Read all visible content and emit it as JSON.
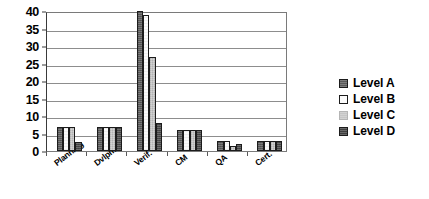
{
  "chart_data": {
    "type": "bar",
    "title": "",
    "subtitle": "",
    "xlabel": "",
    "ylabel": "",
    "categories": [
      "Planning",
      "Dvlpmt",
      "Verif.",
      "CM",
      "QA",
      "Cert."
    ],
    "series": [
      {
        "name": "Level A",
        "color": "#595959",
        "values": [
          7,
          7,
          40,
          6,
          3,
          3
        ]
      },
      {
        "name": "Level B",
        "color": "#fbfbfb",
        "values": [
          7,
          7,
          39,
          6,
          3,
          3
        ]
      },
      {
        "name": "Level C",
        "color": "#c6c6c6",
        "values": [
          7,
          7,
          27,
          6,
          1.5,
          3
        ]
      },
      {
        "name": "Level D",
        "color": "#474747",
        "values": [
          2.5,
          7,
          8,
          6,
          2,
          3
        ]
      }
    ],
    "ylim": [
      0,
      40
    ],
    "yticks": [
      0,
      5,
      10,
      15,
      20,
      25,
      30,
      35,
      40
    ],
    "ytick_labels": [
      "0",
      "5",
      "10",
      "15",
      "20",
      "25",
      "30",
      "35",
      "40"
    ],
    "grid": true,
    "grid_axis": "y",
    "legend": true,
    "legend_position": "right",
    "legend_entries": [
      "Level A",
      "Level B",
      "Level C",
      "Level D"
    ],
    "xtick_rotation": -38,
    "plot_background": "#ffffff",
    "axis_color": "#3a3a3a",
    "gridline_color": "#8d8d8d"
  }
}
